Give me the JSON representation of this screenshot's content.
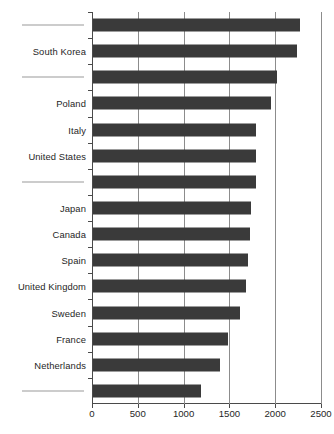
{
  "chart_data": {
    "type": "bar",
    "orientation": "horizontal",
    "title": "",
    "subtitle": "",
    "xlabel": "",
    "ylabel": "",
    "xlim": [
      0,
      2500
    ],
    "ylim": null,
    "grid": true,
    "legend": null,
    "xticks": [
      "0",
      "500",
      "1000",
      "1500",
      "2000",
      "2500"
    ],
    "xtick_values": [
      0,
      500,
      1000,
      1500,
      2000,
      2500
    ],
    "categories": [
      "",
      "South Korea",
      "",
      "Poland",
      "Italy",
      "United States",
      "",
      "Japan",
      "Canada",
      "Spain",
      "United Kingdom",
      "Sweden",
      "France",
      "Netherlands",
      ""
    ],
    "bars": [
      {
        "label": "",
        "redacted": true,
        "value": 2265
      },
      {
        "label": "South Korea",
        "redacted": false,
        "value": 2230
      },
      {
        "label": "",
        "redacted": true,
        "value": 2005
      },
      {
        "label": "Poland",
        "redacted": false,
        "value": 1945
      },
      {
        "label": "Italy",
        "redacted": false,
        "value": 1780
      },
      {
        "label": "United States",
        "redacted": false,
        "value": 1780
      },
      {
        "label": "",
        "redacted": true,
        "value": 1775
      },
      {
        "label": "Japan",
        "redacted": false,
        "value": 1720
      },
      {
        "label": "Canada",
        "redacted": false,
        "value": 1710
      },
      {
        "label": "Spain",
        "redacted": false,
        "value": 1690
      },
      {
        "label": "United Kingdom",
        "redacted": false,
        "value": 1670
      },
      {
        "label": "Sweden",
        "redacted": false,
        "value": 1600
      },
      {
        "label": "France",
        "redacted": false,
        "value": 1470
      },
      {
        "label": "Netherlands",
        "redacted": false,
        "value": 1390
      },
      {
        "label": "",
        "redacted": true,
        "value": 1180
      }
    ],
    "colors": {
      "bar": "#3a3a3a",
      "grid": "#8c8c8c",
      "axis": "#4a4a4a",
      "text": "#262626",
      "background": "#ffffff"
    }
  }
}
